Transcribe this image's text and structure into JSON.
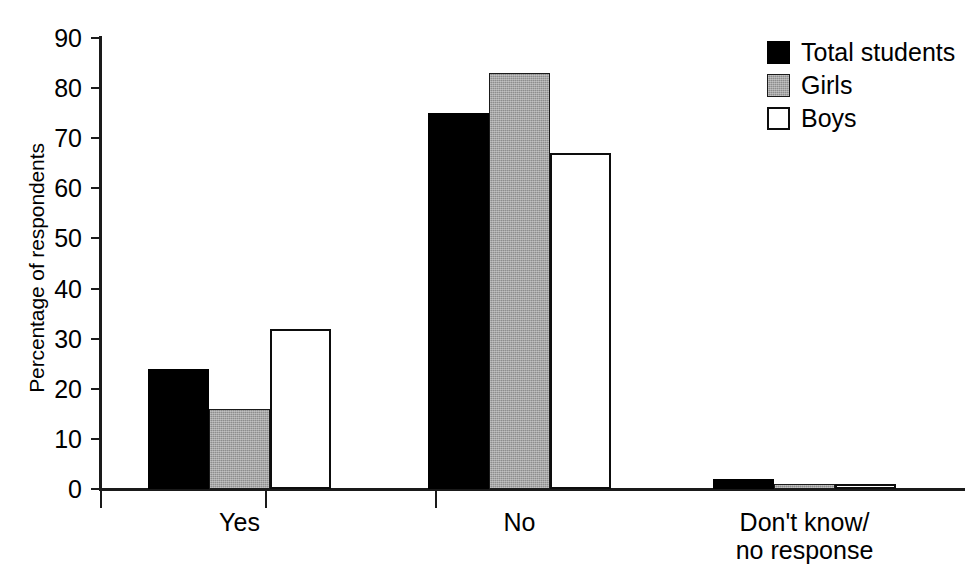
{
  "chart_data": {
    "type": "bar",
    "title": "",
    "xlabel": "",
    "ylabel": "Percentage of respondents",
    "ylim": [
      0,
      90
    ],
    "yticks": [
      0,
      10,
      20,
      30,
      40,
      50,
      60,
      70,
      80,
      90
    ],
    "ytick_labels": [
      "0",
      "10",
      "20",
      "30",
      "40",
      "50",
      "60",
      "70",
      "80",
      "90"
    ],
    "grid": false,
    "legend_position": "top-right",
    "categories": [
      "Yes",
      "No",
      "Don't know/\nno response"
    ],
    "series": [
      {
        "name": "Total students",
        "color": "#000000",
        "fill": "solid-black",
        "values": [
          24,
          75,
          2
        ]
      },
      {
        "name": "Girls",
        "color": "#8d8d8d",
        "fill": "gray-stipple",
        "values": [
          16,
          83,
          1
        ]
      },
      {
        "name": "Boys",
        "color": "#ffffff",
        "fill": "white-outline",
        "values": [
          32,
          67,
          1
        ]
      }
    ]
  },
  "axis": {
    "y_title": "Percentage of respondents",
    "y_tick_labels": [
      "90",
      "80",
      "70",
      "60",
      "50",
      "40",
      "30",
      "20",
      "10",
      "0"
    ],
    "x_tick_labels": [
      "Yes",
      "No",
      "Don't know/\nno response"
    ]
  },
  "legend": {
    "entries": [
      {
        "label": "Total students",
        "swatch": "black-square-icon"
      },
      {
        "label": "Girls",
        "swatch": "gray-square-icon"
      },
      {
        "label": "Boys",
        "swatch": "white-square-icon"
      }
    ]
  }
}
